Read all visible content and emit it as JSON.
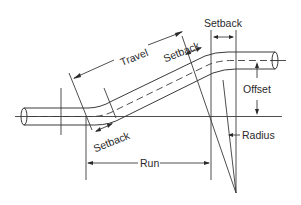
{
  "diagram": {
    "labels": {
      "travel": "Travel",
      "setback_top": "Setback",
      "setback_middle": "Setback",
      "setback_bottom": "Setback",
      "offset": "Offset",
      "radius": "Radius",
      "run": "Run"
    },
    "colors": {
      "line": "#3a3a3a",
      "text": "#2a2a2a",
      "background": "#ffffff"
    }
  }
}
